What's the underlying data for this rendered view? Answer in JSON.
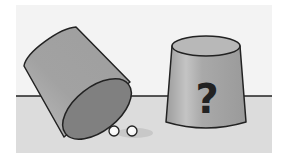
{
  "scene": {
    "description": "Two cups on a table: left cup tipped over revealing two balls, right cup upright with a question mark",
    "left_cup": {
      "state": "tipped-over",
      "balls_revealed": 2
    },
    "right_cup": {
      "state": "upright",
      "label": "?"
    },
    "colors": {
      "wall": "#f2f2f2",
      "table": "#d9d9d9",
      "cup_body": "#a8a8a8",
      "cup_dark": "#7a7a7a",
      "cup_light": "#c8c8c8",
      "outline": "#222222",
      "ball": "#ffffff"
    }
  }
}
